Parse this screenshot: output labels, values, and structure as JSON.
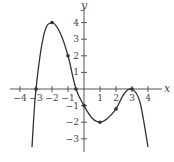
{
  "chart_data": {
    "type": "line",
    "title": "",
    "xlabel": "x",
    "ylabel": "y",
    "xlim": [
      -4.3,
      4.5
    ],
    "ylim": [
      -3.6,
      4.8
    ],
    "grid": false,
    "x_ticks": [
      -4,
      -3,
      -2,
      -1,
      1,
      2,
      3,
      4
    ],
    "y_ticks": [
      -3,
      -2,
      -1,
      1,
      2,
      3,
      4
    ],
    "x_tick_labels": [
      "−4",
      "−3",
      "−2",
      "−1",
      "1",
      "2",
      "3",
      "4"
    ],
    "y_tick_labels": [
      "−3",
      "−2",
      "−1",
      "1",
      "2",
      "3",
      "4"
    ],
    "series": [
      {
        "name": "f(x)",
        "color": "#333333",
        "marked_points": [
          {
            "x": -3,
            "y": 0
          },
          {
            "x": -2,
            "y": 4
          },
          {
            "x": -1,
            "y": 2
          },
          {
            "x": -0.5,
            "y": 0
          },
          {
            "x": 0,
            "y": -1
          },
          {
            "x": 1,
            "y": -2
          },
          {
            "x": 2,
            "y": -1.2
          },
          {
            "x": 3,
            "y": 0
          }
        ],
        "curve": [
          {
            "x": -3.25,
            "y": -3.5
          },
          {
            "x": -3,
            "y": 0
          },
          {
            "x": -2.5,
            "y": 3.3
          },
          {
            "x": -2,
            "y": 4
          },
          {
            "x": -1.5,
            "y": 3.4
          },
          {
            "x": -1,
            "y": 2
          },
          {
            "x": -0.5,
            "y": 0
          },
          {
            "x": 0,
            "y": -1
          },
          {
            "x": 0.5,
            "y": -1.75
          },
          {
            "x": 1,
            "y": -2
          },
          {
            "x": 1.5,
            "y": -1.75
          },
          {
            "x": 2,
            "y": -1.2
          },
          {
            "x": 2.5,
            "y": -0.3
          },
          {
            "x": 3,
            "y": 0
          },
          {
            "x": 3.5,
            "y": -0.8
          },
          {
            "x": 4,
            "y": -3.5
          }
        ]
      }
    ]
  }
}
